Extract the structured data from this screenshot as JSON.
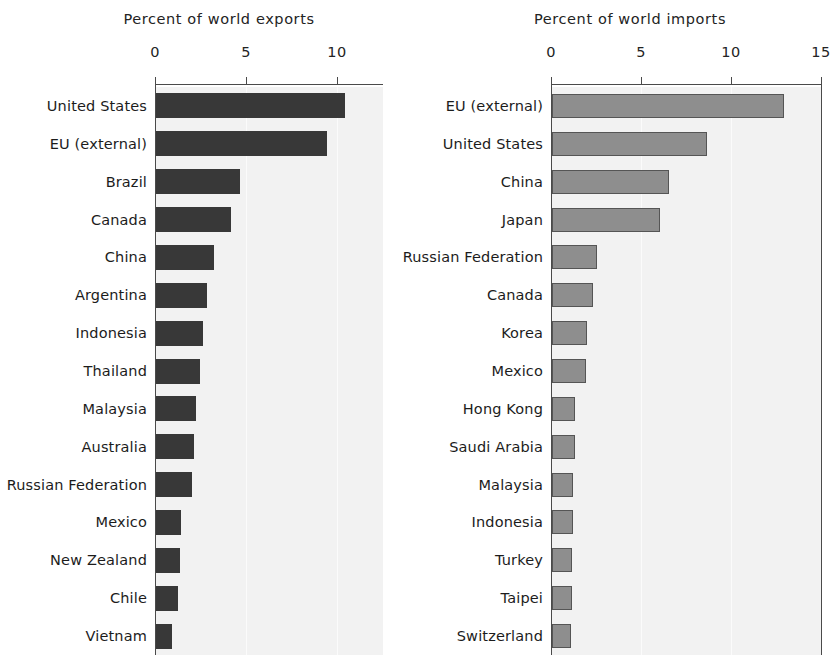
{
  "chart_data": [
    {
      "type": "bar",
      "orientation": "horizontal",
      "title": "Percent of world exports",
      "xlabel": "",
      "ylabel": "",
      "xlim": [
        0,
        11.5
      ],
      "xticks": [
        0,
        5,
        10
      ],
      "xticklabels": [
        "0",
        "5",
        "10"
      ],
      "grid": true,
      "legend": "none",
      "bar_color": "#383838",
      "categories": [
        "United States",
        "EU (external)",
        "Brazil",
        "Canada",
        "China",
        "Argentina",
        "Indonesia",
        "Thailand",
        "Malaysia",
        "Australia",
        "Russian Federation",
        "Mexico",
        "New Zealand",
        "Chile",
        "Vietnam"
      ],
      "values": [
        10.4,
        9.4,
        4.6,
        4.1,
        3.2,
        2.8,
        2.6,
        2.4,
        2.2,
        2.1,
        2.0,
        1.4,
        1.3,
        1.2,
        0.9
      ]
    },
    {
      "type": "bar",
      "orientation": "horizontal",
      "title": "Percent of world imports",
      "xlabel": "",
      "ylabel": "",
      "xlim": [
        0,
        15
      ],
      "xticks": [
        0,
        5,
        10,
        15
      ],
      "xticklabels": [
        "0",
        "5",
        "10",
        "15"
      ],
      "grid": true,
      "legend": "none",
      "bar_color": "#8e8e8e",
      "categories": [
        "EU (external)",
        "United States",
        "China",
        "Japan",
        "Russian Federation",
        "Canada",
        "Korea",
        "Mexico",
        "Hong Kong",
        "Saudi Arabia",
        "Malaysia",
        "Indonesia",
        "Turkey",
        "Taipei",
        "Switzerland"
      ],
      "values": [
        12.9,
        8.6,
        6.5,
        6.0,
        2.5,
        2.3,
        1.95,
        1.9,
        1.25,
        1.25,
        1.15,
        1.15,
        1.1,
        1.1,
        1.05
      ]
    }
  ]
}
